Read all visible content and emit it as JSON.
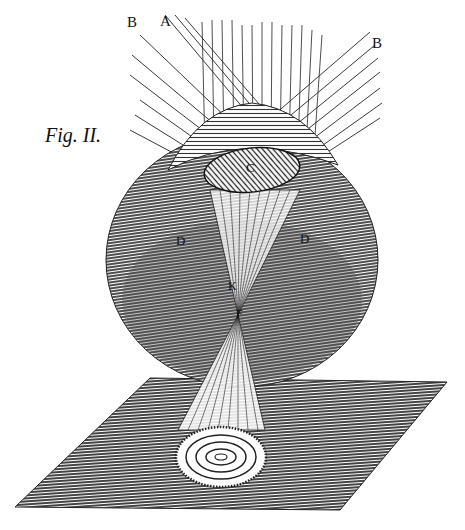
{
  "figure": {
    "caption": "Fig. II.",
    "labels": {
      "A": "A",
      "B_left": "B",
      "B_right": "B",
      "C": "C",
      "D_left": "D",
      "D_right": "D",
      "K": "K",
      "F": "F"
    }
  },
  "colors": {
    "ink": "#111111",
    "paper": "#ffffff",
    "shade": "#3a3a3a"
  }
}
